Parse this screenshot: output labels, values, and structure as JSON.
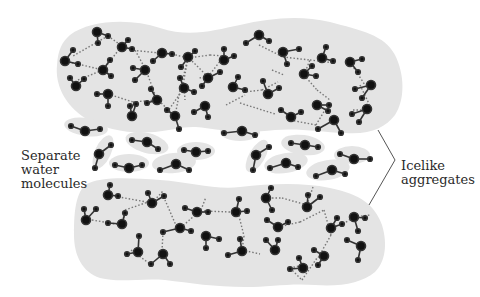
{
  "figure": {
    "labels": {
      "separate": [
        "Separate",
        "water",
        "molecules"
      ],
      "icelike": [
        "Icelike",
        "aggregates"
      ]
    },
    "colors": {
      "background": "#ffffff",
      "cluster_fill": "#e4e4e4",
      "atom": "#111111",
      "covalent_bond": "#333333",
      "hydrogen_bond": "#777777",
      "bracket": "#555555",
      "text": "#2a2a2a"
    },
    "legend_semantics": {
      "large_dot": "oxygen atom",
      "small_dot": "hydrogen atom",
      "solid_line": "covalent bond",
      "dotted_line": "hydrogen bond"
    }
  }
}
